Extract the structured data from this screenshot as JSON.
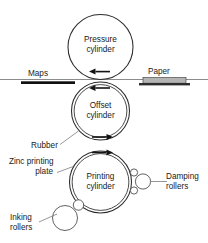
{
  "diagram": {
    "background_color": "#ffffff",
    "line_color": "#2b2b2b",
    "text_color": "#1a1a1a",
    "width": 208,
    "height": 243
  },
  "labels": {
    "pressure_cylinder_line1": "Pressure",
    "pressure_cylinder_line2": "cylinder",
    "offset_cylinder_line1": "Offset",
    "offset_cylinder_line2": "cylinder",
    "printing_cylinder_line1": "Printing",
    "printing_cylinder_line2": "cylinder",
    "maps": "Maps",
    "paper": "Paper",
    "rubber": "Rubber",
    "zinc_plate_line1": "Zinc  printing",
    "zinc_plate_line2": "plate",
    "damping_rollers_line1": "Damping",
    "damping_rollers_line2": "rollers",
    "inking_rollers_line1": "Inking",
    "inking_rollers_line2": "rollers"
  },
  "components": {
    "pressure_cylinder": {
      "cx": 100.5,
      "cy": 47,
      "r": 32.5,
      "double_wall": false
    },
    "offset_cylinder": {
      "cx": 100.5,
      "cy": 111,
      "r": 29,
      "double_wall": true,
      "wall_gap": 2.6
    },
    "printing_cylinder": {
      "cx": 100.5,
      "cy": 182,
      "r": 31,
      "double_wall": true,
      "wall_gap": 2.6
    },
    "damping_roller_top": {
      "cx": 134,
      "cy": 172.5,
      "r": 3.6
    },
    "damping_roller_bottom": {
      "cx": 134,
      "cy": 190.5,
      "r": 3.6
    },
    "damping_roller_large": {
      "cx": 143,
      "cy": 181.5,
      "r": 7.6
    },
    "inking_roller_large": {
      "cx": 65,
      "cy": 218,
      "r": 12.5
    },
    "inking_roller_small": {
      "cx": 78.5,
      "cy": 205,
      "r": 5.2
    },
    "maps_bar": {
      "x": 21,
      "y": 81.5,
      "width": 54,
      "height": 2.6
    },
    "paper_sheet": {
      "x": 143,
      "y": 77.5,
      "width": 43,
      "height": 5.5
    },
    "paper_base": {
      "x": 139,
      "y": 83,
      "width": 51,
      "height": 2.4
    },
    "nip_line": {
      "x1": 0,
      "y1": 79.5,
      "x2": 208,
      "y2": 79.5
    }
  },
  "rotation_arrows": [
    {
      "name": "pressure-cylinder-arrow",
      "direction": "left",
      "x": 97,
      "y": 72
    },
    {
      "name": "offset-cylinder-top-arrow",
      "direction": "left",
      "x": 97,
      "y": 88
    },
    {
      "name": "offset-cylinder-bottom-arrow",
      "direction": "right",
      "x": 104,
      "y": 137
    },
    {
      "name": "printing-cylinder-arrow",
      "direction": "right",
      "x": 104,
      "y": 152
    }
  ]
}
